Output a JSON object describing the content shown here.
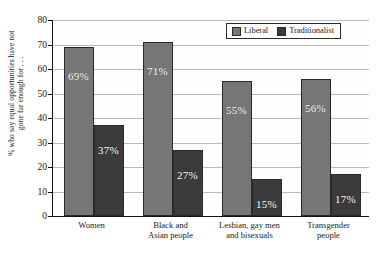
{
  "chart_data": {
    "type": "bar",
    "title": "",
    "xlabel": "",
    "ylabel_line1": "% who say equal opportunities have not",
    "ylabel_line2": "gone far enough for . . .",
    "ylim": [
      0,
      80
    ],
    "yticks": [
      0,
      10,
      20,
      30,
      40,
      50,
      60,
      70,
      80
    ],
    "grid": true,
    "legend_position": "top-right",
    "categories": [
      [
        "Women"
      ],
      [
        "Black and",
        "Asian people"
      ],
      [
        "Lesbian, gay men",
        "and bisexuals"
      ],
      [
        "Transgender",
        "people"
      ]
    ],
    "series": [
      {
        "name": "Liberal",
        "color": "#767676",
        "values": [
          69,
          71,
          55,
          56
        ],
        "labels": [
          "69%",
          "71%",
          "55%",
          "56%"
        ]
      },
      {
        "name": "Traditionalist",
        "color": "#3b3b3b",
        "values": [
          37,
          27,
          15,
          17
        ],
        "labels": [
          "37%",
          "27%",
          "15%",
          "17%"
        ]
      }
    ]
  },
  "legend": {
    "items": [
      {
        "label": "Liberal",
        "swatch": "liberal"
      },
      {
        "label": "Traditionalist",
        "swatch": "trad"
      }
    ]
  }
}
